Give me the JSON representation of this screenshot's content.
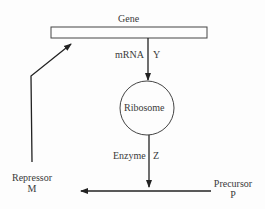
{
  "diagram": {
    "type": "gene regulation feedback diagram",
    "nodes": {
      "gene": {
        "label": "Gene"
      },
      "ribosome": {
        "label": "Ribosome"
      },
      "repressor": {
        "label": "Repressor",
        "symbol": "M"
      },
      "precursor": {
        "label": "Precursor",
        "symbol": "P"
      }
    },
    "edges": {
      "mrna": {
        "label": "mRNA",
        "symbol": "Y",
        "from": "gene",
        "to": "ribosome"
      },
      "enzyme": {
        "label": "Enzyme",
        "symbol": "Z",
        "from": "ribosome",
        "to": "precursor-repressor-line"
      },
      "conversion": {
        "from": "precursor",
        "to": "repressor"
      },
      "repression": {
        "from": "repressor",
        "to": "gene"
      }
    }
  }
}
